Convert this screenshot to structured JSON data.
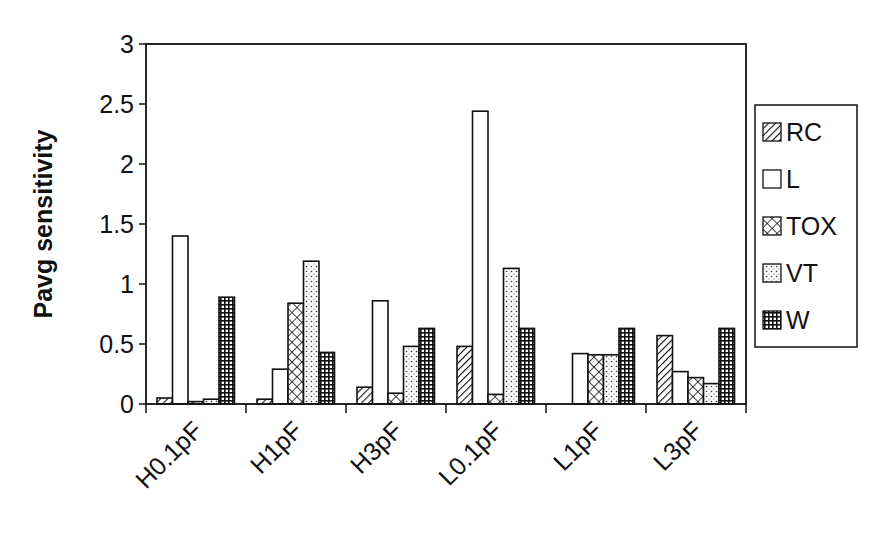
{
  "chart_data": {
    "type": "bar",
    "title": "",
    "xlabel": "",
    "ylabel": "Pavg sensitivity",
    "ylim": [
      0,
      3
    ],
    "yticks": [
      "0",
      "0.5",
      "1",
      "1.5",
      "2",
      "2.5",
      "3"
    ],
    "ytick_values": [
      0,
      0.5,
      1,
      1.5,
      2,
      2.5,
      3
    ],
    "grid": false,
    "legend_position": "right",
    "categories": [
      "H0.1pF",
      "H1pF",
      "H3pF",
      "L0.1pF",
      "L1pF",
      "L3pF"
    ],
    "series": [
      {
        "name": "RC",
        "pattern": "diagonal-hatch",
        "values": [
          0.05,
          0.04,
          0.14,
          0.48,
          0.0,
          0.57
        ]
      },
      {
        "name": "L",
        "pattern": "solid-white",
        "values": [
          1.4,
          0.29,
          0.86,
          2.44,
          0.42,
          0.27
        ]
      },
      {
        "name": "TOX",
        "pattern": "crosshatch",
        "values": [
          0.02,
          0.84,
          0.09,
          0.08,
          0.41,
          0.22
        ]
      },
      {
        "name": "VT",
        "pattern": "dotted",
        "values": [
          0.04,
          1.19,
          0.48,
          1.13,
          0.41,
          0.17
        ]
      },
      {
        "name": "W",
        "pattern": "grid",
        "values": [
          0.89,
          0.43,
          0.63,
          0.63,
          0.63,
          0.63
        ]
      }
    ]
  },
  "colors": {
    "ink": "#111111",
    "background": "#ffffff"
  }
}
